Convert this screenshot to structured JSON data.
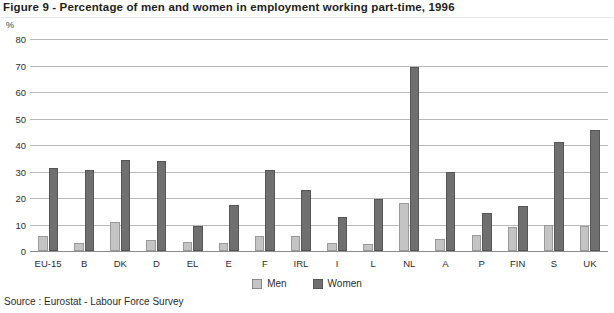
{
  "figure": {
    "title": "Figure 9 - Percentage of men and women in employment working part-time, 1996",
    "unit": "%",
    "source": "Source : Eurostat - Labour Force Survey"
  },
  "legend": {
    "position": "bottom-center",
    "entries": [
      {
        "label": "Men",
        "color": "#c4c4c4"
      },
      {
        "label": "Women",
        "color": "#6f6f6f"
      }
    ]
  },
  "axis": {
    "y_ticks": [
      "0",
      "10",
      "20",
      "30",
      "40",
      "50",
      "60",
      "70",
      "80"
    ]
  },
  "chart_data": {
    "type": "bar",
    "title": "Figure 9 - Percentage of men and women in employment working part-time, 1996",
    "xlabel": "",
    "ylabel": "%",
    "ylim": [
      0,
      80
    ],
    "grid": true,
    "legend_position": "bottom-center",
    "categories": [
      "EU-15",
      "B",
      "DK",
      "D",
      "EL",
      "E",
      "F",
      "IRL",
      "I",
      "L",
      "NL",
      "A",
      "P",
      "FIN",
      "S",
      "UK"
    ],
    "series": [
      {
        "name": "Men",
        "color": "#c4c4c4",
        "values": [
          5.5,
          3.0,
          11.0,
          4.0,
          3.5,
          3.0,
          5.5,
          5.5,
          3.0,
          2.5,
          18.0,
          4.5,
          6.0,
          9.0,
          10.0,
          9.5
        ]
      },
      {
        "name": "Women",
        "color": "#6f6f6f",
        "values": [
          31.5,
          30.5,
          34.5,
          34.0,
          9.5,
          17.5,
          30.5,
          23.0,
          13.0,
          19.5,
          69.5,
          30.0,
          14.5,
          17.0,
          41.0,
          45.5
        ]
      }
    ],
    "source": "Source : Eurostat - Labour Force Survey"
  }
}
